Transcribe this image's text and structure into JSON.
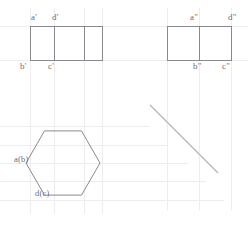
{
  "drawing": {
    "type": "orthographic-projection",
    "canvas": {
      "width": 248,
      "height": 226,
      "background": "#ffffff"
    },
    "colors": {
      "object_line": "#8a8a8e",
      "construction_line": "#ededf0",
      "miter_line": "#b0b0b5",
      "text": "#6e6e72"
    },
    "views": {
      "front": {
        "name": "front-view",
        "shape": "rectangle-three-cells",
        "x": 30,
        "y": 26,
        "width": 72,
        "height": 34,
        "dividers": [
          54,
          84
        ],
        "labels": [
          {
            "text": "a'",
            "x": 31,
            "y": 13
          },
          {
            "text": "d'",
            "x": 52,
            "y": 13
          },
          {
            "text": "b'",
            "x": 20,
            "y": 62
          },
          {
            "text": "c'",
            "x": 48,
            "y": 62
          }
        ]
      },
      "side": {
        "name": "side-view",
        "shape": "rectangle-two-cells",
        "x": 167,
        "y": 26,
        "width": 64,
        "height": 34,
        "dividers": [
          199
        ],
        "labels": [
          {
            "text": "a\"",
            "x": 190,
            "y": 13
          },
          {
            "text": "d\"",
            "x": 228,
            "y": 13
          },
          {
            "text": "b\"",
            "x": 193,
            "y": 62
          },
          {
            "text": "c\"",
            "x": 222,
            "y": 62
          }
        ]
      },
      "top": {
        "name": "top-view",
        "shape": "hexagon",
        "center_x": 63,
        "center_y": 163,
        "radius": 37,
        "labels": [
          {
            "text": "a(b)",
            "x": 14,
            "y": 155
          },
          {
            "text": "d(c)",
            "x": 35,
            "y": 189
          }
        ]
      }
    },
    "miter_line": {
      "name": "miter-line",
      "x1": 150,
      "y1": 105,
      "x2": 218,
      "y2": 173
    },
    "construction_lines": {
      "horizontal": [
        26,
        60,
        126,
        145,
        163,
        181,
        200
      ],
      "vertical": [
        30,
        54,
        84,
        102,
        167,
        199,
        231
      ]
    }
  }
}
